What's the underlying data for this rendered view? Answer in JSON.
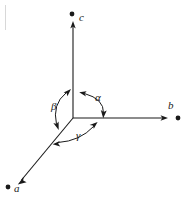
{
  "figure": {
    "kind": "crystallographic-axes-diagram",
    "width": 186,
    "height": 197,
    "background_color": "#ffffff",
    "stroke_color": "#1a1a1a",
    "line_width": 1
  },
  "axes": [
    {
      "id": "a",
      "label": "a",
      "direction": "down-left",
      "origin": {
        "x": 73,
        "y": 118
      },
      "tip": {
        "x": 19,
        "y": 183
      },
      "endpoint_dot": {
        "x": 8,
        "y": 187
      },
      "label_position": {
        "x": 14,
        "y": 183
      },
      "arrowhead": true
    },
    {
      "id": "b",
      "label": "b",
      "direction": "right",
      "origin": {
        "x": 73,
        "y": 118
      },
      "tip": {
        "x": 166,
        "y": 118
      },
      "endpoint_dot": {
        "x": 178,
        "y": 118
      },
      "label_position": {
        "x": 168,
        "y": 100
      },
      "arrowhead": true
    },
    {
      "id": "c",
      "label": "c",
      "direction": "up",
      "origin": {
        "x": 73,
        "y": 118
      },
      "tip": {
        "x": 73,
        "y": 23
      },
      "endpoint_dot": {
        "x": 72,
        "y": 14
      },
      "label_position": {
        "x": 79,
        "y": 12
      },
      "arrowhead": true
    }
  ],
  "angles": [
    {
      "id": "alpha",
      "label": "α",
      "between": [
        "b",
        "c"
      ],
      "label_position": {
        "x": 95,
        "y": 92
      },
      "double_headed": true
    },
    {
      "id": "beta",
      "label": "β",
      "between": [
        "a",
        "c"
      ],
      "label_position": {
        "x": 51,
        "y": 101
      },
      "double_headed": true
    },
    {
      "id": "gamma",
      "label": "γ",
      "between": [
        "a",
        "b"
      ],
      "label_position": {
        "x": 76,
        "y": 130
      },
      "double_headed": true
    }
  ],
  "colors": {
    "stroke": "#1a1a1a",
    "background": "#ffffff",
    "edge_artifact": "#d8d8d8"
  }
}
